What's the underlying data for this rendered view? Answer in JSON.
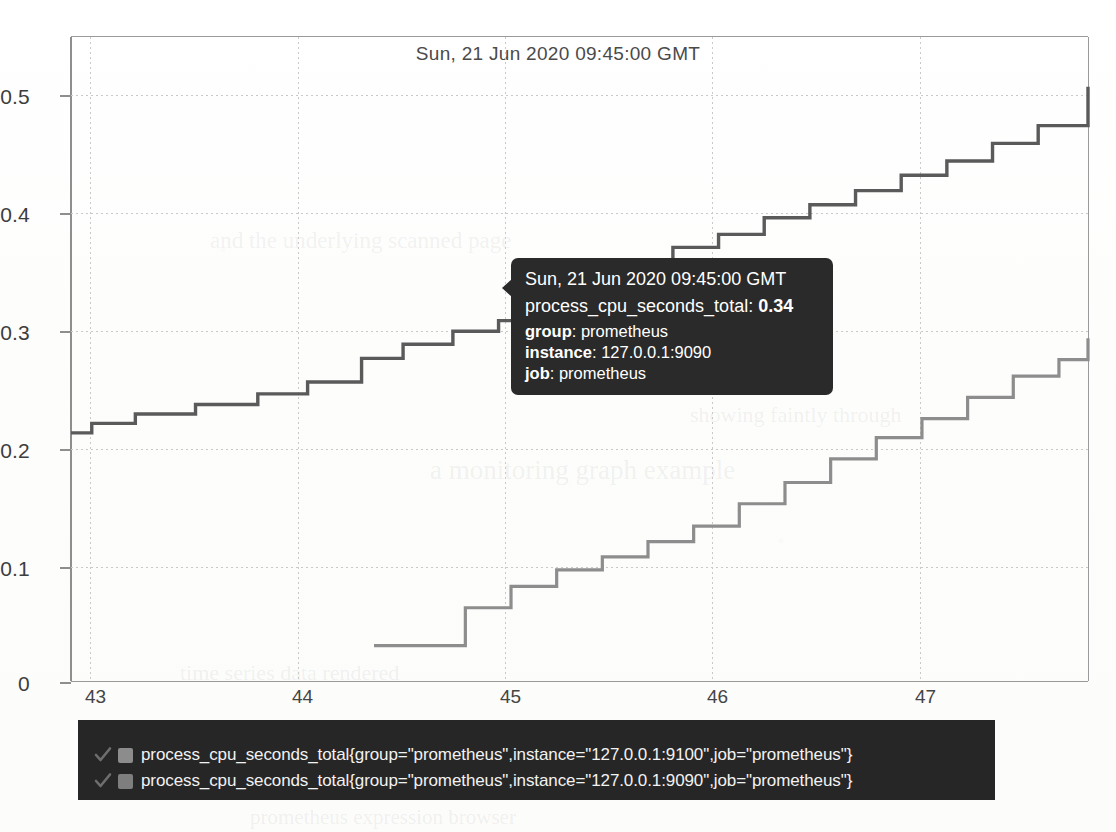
{
  "chart_data": {
    "type": "line",
    "step": "post",
    "title": "Sun, 21 Jun 2020 09:45:00 GMT",
    "xlabel": "",
    "ylabel": "",
    "xlim": [
      42.62,
      47.52
    ],
    "ylim": [
      0,
      0.545
    ],
    "grid": true,
    "legend_position": "bottom",
    "xticks": [
      "43",
      "44",
      "45",
      "46",
      "47"
    ],
    "xtick_values": [
      43,
      44,
      45,
      46,
      47
    ],
    "yticks": [
      "0",
      "0.1",
      "0.2",
      "0.3",
      "0.4",
      "0.5"
    ],
    "ytick_values": [
      0,
      0.1,
      0.2,
      0.3,
      0.4,
      0.5
    ],
    "series": [
      {
        "name": "process_cpu_seconds_total{group=\"prometheus\",instance=\"127.0.0.1:9100\",job=\"prometheus\"}",
        "color": "#5a5a5a",
        "x": [
          42.62,
          42.72,
          42.93,
          43.22,
          43.52,
          43.76,
          44.02,
          44.22,
          44.46,
          44.68,
          44.9,
          45.12,
          45.32,
          45.52,
          45.74,
          45.96,
          46.18,
          46.4,
          46.62,
          46.84,
          47.06,
          47.28,
          47.52
        ],
        "y": [
          0.21,
          0.218,
          0.226,
          0.234,
          0.243,
          0.253,
          0.273,
          0.285,
          0.296,
          0.305,
          0.318,
          0.33,
          0.345,
          0.367,
          0.378,
          0.392,
          0.403,
          0.415,
          0.428,
          0.44,
          0.455,
          0.47,
          0.503
        ]
      },
      {
        "name": "process_cpu_seconds_total{group=\"prometheus\",instance=\"127.0.0.1:9090\",job=\"prometheus\"}",
        "color": "#8d8d8d",
        "x": [
          44.08,
          44.3,
          44.52,
          44.74,
          44.96,
          45.18,
          45.4,
          45.62,
          45.84,
          46.06,
          46.28,
          46.5,
          46.72,
          46.94,
          47.16,
          47.38,
          47.52
        ],
        "y": [
          0.03,
          0.03,
          0.062,
          0.08,
          0.094,
          0.105,
          0.118,
          0.131,
          0.15,
          0.168,
          0.188,
          0.206,
          0.222,
          0.24,
          0.258,
          0.272,
          0.29
        ]
      }
    ]
  },
  "tooltip": {
    "time": "Sun, 21 Jun 2020 09:45:00 GMT",
    "metric_name": "process_cpu_seconds_total:",
    "metric_value": "0.34",
    "labels": [
      {
        "key": "group",
        "sep": ": ",
        "value": "prometheus"
      },
      {
        "key": "instance",
        "sep": ": ",
        "value": "127.0.0.1:9090"
      },
      {
        "key": "job",
        "sep": ": ",
        "value": "prometheus"
      }
    ]
  },
  "legend": {
    "background": "#262626",
    "items": [
      {
        "label": "process_cpu_seconds_total{group=\"prometheus\",instance=\"127.0.0.1:9100\",job=\"prometheus\"}",
        "swatch": "#8c8c8c",
        "checked": true
      },
      {
        "label": "process_cpu_seconds_total{group=\"prometheus\",instance=\"127.0.0.1:9090\",job=\"prometheus\"}",
        "swatch": "#7e7e7e",
        "checked": true
      }
    ]
  },
  "background_ghost_text": [
    "and the underlying scanned page",
    "showing faintly through",
    "a monitoring graph example",
    "time series data rendered",
    "prometheus expression browser"
  ]
}
